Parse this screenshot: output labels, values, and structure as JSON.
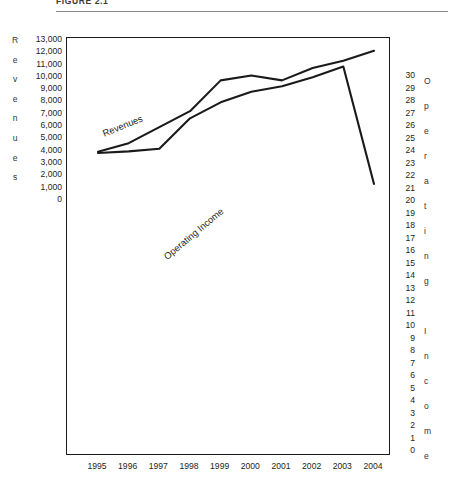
{
  "figure": {
    "caption": "FIGURE 2.1"
  },
  "axes": {
    "left_title_letters": [
      "R",
      "e",
      "v",
      "e",
      "n",
      "u",
      "e",
      "s"
    ],
    "left_ticks": [
      "13,000",
      "12,000",
      "11,000",
      "10,000",
      "9,000",
      "8,000",
      "7,000",
      "6,000",
      "5,000",
      "4,000",
      "3,000",
      "2,000",
      "1,000",
      "0"
    ],
    "right_title_letters": [
      "O",
      "p",
      "e",
      "r",
      "a",
      "t",
      "i",
      "n",
      "g",
      " ",
      "I",
      "n",
      "c",
      "o",
      "m",
      "e"
    ],
    "right_ticks": [
      "30",
      "29",
      "28",
      "27",
      "26",
      "25",
      "24",
      "23",
      "22",
      "21",
      "20",
      "19",
      "18",
      "17",
      "16",
      "15",
      "14",
      "13",
      "12",
      "11",
      "10",
      "9",
      "8",
      "7",
      "6",
      "5",
      "4",
      "3",
      "2",
      "1",
      "0"
    ],
    "x_ticks": [
      "1995",
      "1996",
      "1997",
      "1998",
      "1999",
      "2000",
      "2001",
      "2002",
      "2003",
      "2004"
    ]
  },
  "series_labels": {
    "revenues": "Revenues",
    "operating_income": "Operating Income"
  },
  "chart_data": {
    "type": "line",
    "title": "FIGURE 2.1",
    "xlabel": "",
    "ylabel": "Revenues",
    "y2label": "Operating Income",
    "x": [
      "1995",
      "1996",
      "1997",
      "1998",
      "1999",
      "2000",
      "2001",
      "2002",
      "2003",
      "2004"
    ],
    "ylim": [
      0,
      13000
    ],
    "y2lim": [
      0,
      30
    ],
    "grid": false,
    "legend": "inline-labels",
    "line_color": "#1a1a1a",
    "series": [
      {
        "name": "Revenues",
        "axis": "left",
        "values": [
          4000,
          4700,
          6000,
          7300,
          9800,
          10200,
          9800,
          10800,
          11400,
          12200
        ]
      },
      {
        "name": "Operating Income",
        "axis": "right",
        "values": [
          9,
          9.3,
          9.8,
          15.5,
          18.5,
          20.5,
          21.5,
          23.2,
          25.2,
          3.2
        ]
      }
    ]
  }
}
